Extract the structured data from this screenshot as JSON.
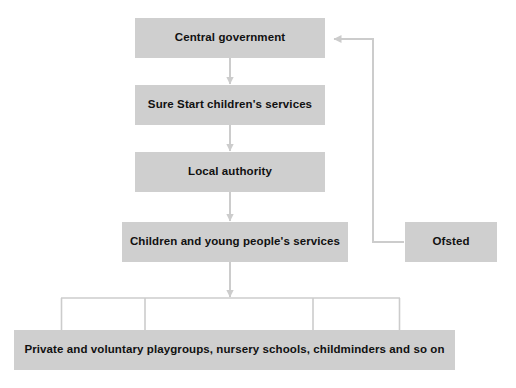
{
  "diagram": {
    "type": "flowchart",
    "width": 516,
    "height": 388,
    "background_color": "#ffffff",
    "node_fill_color": "#cfcfcf",
    "connector_color": "#cccccc",
    "text_color": "#111111",
    "nodes": [
      {
        "id": "central",
        "label": "Central government"
      },
      {
        "id": "surestart",
        "label": "Sure Start children's services"
      },
      {
        "id": "localauth",
        "label": "Local authority"
      },
      {
        "id": "cyps",
        "label": "Children and young people's services"
      },
      {
        "id": "ofsted",
        "label": "Ofsted"
      },
      {
        "id": "providers",
        "label": "Private and voluntary playgroups, nursery schools, childminders and so on"
      }
    ],
    "edges": [
      {
        "from": "central",
        "to": "surestart",
        "style": "arrow-down"
      },
      {
        "from": "surestart",
        "to": "localauth",
        "style": "arrow-down"
      },
      {
        "from": "localauth",
        "to": "cyps",
        "style": "arrow-down"
      },
      {
        "from": "cyps",
        "to": "providers",
        "style": "arrow-down-to-distributor"
      },
      {
        "from": "ofsted",
        "to": "central",
        "style": "elbow-arrow-left"
      }
    ],
    "distributor": {
      "branch_count": 4,
      "description": "horizontal bar beneath Children and young people's services fanning out to the providers box"
    }
  }
}
